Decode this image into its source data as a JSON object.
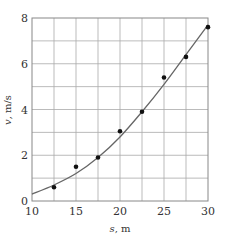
{
  "chart_data": {
    "type": "scatter",
    "title": "",
    "xlabel": "s, m",
    "ylabel": "v, m/s",
    "xlim": [
      10,
      30
    ],
    "ylim": [
      0,
      8
    ],
    "xticks": [
      10,
      15,
      20,
      25,
      30
    ],
    "yticks": [
      0,
      2,
      4,
      6,
      8
    ],
    "grid": true,
    "grid_x_step": 2.5,
    "grid_y_step": 1,
    "legend": null,
    "series": [
      {
        "name": "measured",
        "kind": "points",
        "x": [
          12.5,
          15,
          17.5,
          20,
          22.5,
          25,
          27.5,
          30
        ],
        "y": [
          0.6,
          1.5,
          1.9,
          3.05,
          3.9,
          5.4,
          6.3,
          7.6
        ]
      },
      {
        "name": "fit",
        "kind": "curve",
        "x": [
          10,
          12.5,
          15,
          17.5,
          20,
          22.5,
          25,
          27.5,
          30
        ],
        "y": [
          0.3,
          0.7,
          1.2,
          1.9,
          2.8,
          3.9,
          5.1,
          6.4,
          7.7
        ]
      }
    ],
    "colors": {
      "points": "#111111",
      "curve": "#666666",
      "grid": "#aaaaaa"
    }
  }
}
